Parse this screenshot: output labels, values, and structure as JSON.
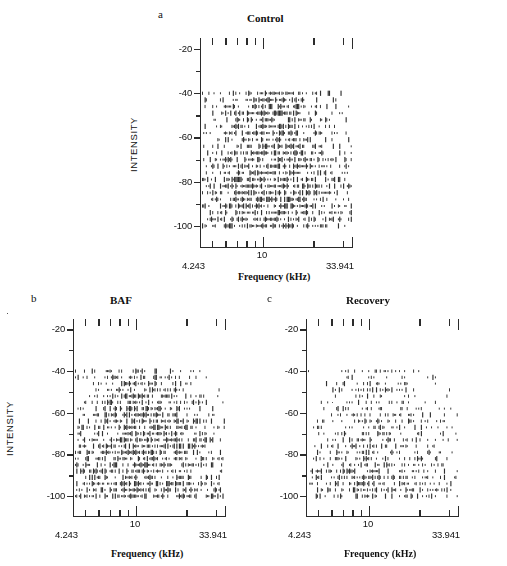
{
  "figure": {
    "background_color": "#ffffff",
    "ink_color": "#2b2b2b",
    "width": 507,
    "height": 566
  },
  "axis_titles": {
    "x": "Frequency (kHz)",
    "y": "INTENSITY"
  },
  "axis": {
    "x_min_label": "4.243",
    "x_mid_label": "10",
    "x_max_label": "33.941",
    "x_min": 4.243,
    "x_max": 33.941,
    "x_scale": "log",
    "y_min": -110,
    "y_max": -15,
    "y_ticks": [
      -20,
      -40,
      -60,
      -80,
      -100
    ],
    "y_tick_labels": [
      "-20",
      "-40",
      "-60",
      "-80",
      "-100"
    ],
    "x_tick_values": [
      4.243,
      5,
      6,
      7,
      8,
      9,
      10,
      20,
      30,
      33.941
    ]
  },
  "panels": [
    {
      "letter": "a",
      "title": "Control",
      "id": "panel-control"
    },
    {
      "letter": "b",
      "title": "BAF",
      "id": "panel-baf"
    },
    {
      "letter": "c",
      "title": "Recovery",
      "id": "panel-recovery"
    }
  ],
  "chart_data": {
    "type": "scatter",
    "xlabel": "Frequency (kHz)",
    "ylabel": "INTENSITY",
    "xlim": [
      4.243,
      33.941
    ],
    "ylim": [
      -110,
      -15
    ],
    "xscale": "log",
    "grid": false,
    "legend": "none",
    "panels": [
      {
        "name": "Control",
        "letter": "a",
        "intensity_rows": [
          -40,
          -43,
          -46,
          -49,
          -52,
          -55,
          -58,
          -61,
          -64,
          -67,
          -70,
          -73,
          -76,
          -79,
          -82,
          -85,
          -88,
          -91,
          -94,
          -97,
          -100
        ],
        "row_density": [
          0.74,
          0.8,
          0.82,
          0.84,
          0.84,
          0.82,
          0.8,
          0.82,
          0.83,
          0.85,
          0.86,
          0.86,
          0.85,
          0.84,
          0.84,
          0.83,
          0.82,
          0.82,
          0.81,
          0.8,
          0.78
        ],
        "threshold_intensity": -40,
        "max_intensity_tested": -100,
        "seed": 17
      },
      {
        "name": "BAF",
        "letter": "b",
        "intensity_rows": [
          -40,
          -43,
          -46,
          -49,
          -52,
          -55,
          -58,
          -61,
          -64,
          -67,
          -70,
          -73,
          -76,
          -79,
          -82,
          -85,
          -88,
          -91,
          -94,
          -97,
          -100
        ],
        "row_density": [
          0.52,
          0.58,
          0.66,
          0.7,
          0.72,
          0.72,
          0.74,
          0.76,
          0.76,
          0.78,
          0.78,
          0.79,
          0.8,
          0.8,
          0.8,
          0.79,
          0.78,
          0.78,
          0.77,
          0.76,
          0.74
        ],
        "threshold_intensity": -40,
        "max_intensity_tested": -100,
        "seed": 43
      },
      {
        "name": "Recovery",
        "letter": "c",
        "intensity_rows": [
          -40,
          -43,
          -46,
          -49,
          -52,
          -55,
          -58,
          -61,
          -64,
          -67,
          -70,
          -73,
          -76,
          -79,
          -82,
          -85,
          -88,
          -91,
          -94,
          -97,
          -100
        ],
        "row_density": [
          0.34,
          0.32,
          0.3,
          0.33,
          0.31,
          0.36,
          0.38,
          0.4,
          0.42,
          0.44,
          0.46,
          0.48,
          0.5,
          0.52,
          0.54,
          0.56,
          0.58,
          0.58,
          0.57,
          0.55,
          0.52
        ],
        "threshold_intensity": -40,
        "max_intensity_tested": -100,
        "seed": 91
      }
    ]
  }
}
